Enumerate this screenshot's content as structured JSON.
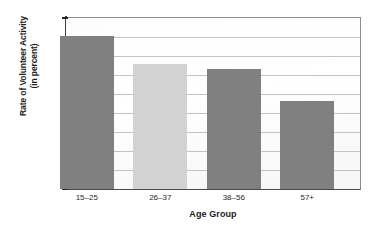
{
  "chart_data": {
    "type": "bar",
    "title": "",
    "categories": [
      "15–25",
      "26–37",
      "38–56",
      "57+"
    ],
    "values": [
      40.3,
      32.8,
      31.7,
      23.1
    ],
    "series": [
      {
        "name": "Rate of Volunteer Activity",
        "values": [
          40.3,
          32.8,
          31.7,
          23.1
        ]
      }
    ],
    "xlabel": "Age Group",
    "ylabel": "Rate of Volunteer Activity (in percent)",
    "ylabel_line1": "Rate of Volunteer Activity",
    "ylabel_line2": "(in percent)",
    "ylim": [
      0,
      45
    ],
    "ytick_step": 5,
    "yticks": [
      45,
      40,
      35,
      30,
      25,
      20,
      15,
      10,
      5,
      0
    ],
    "ytick_labels": [
      "45",
      "40",
      "35",
      "30",
      "25",
      "20",
      "15",
      "10",
      "5",
      "0"
    ],
    "grid": true,
    "grid_axis": "y",
    "legend": false,
    "legend_position": "none",
    "bar_colors": [
      "#808080",
      "#d2d2d2",
      "#808080",
      "#808080"
    ],
    "colors": {
      "bar_dark": "#808080",
      "bar_light": "#d2d2d2",
      "gridline": "#c3c3c3",
      "axis": "#3b3b3b",
      "text": "#1f1f1f",
      "plot_background": "#fdfdfd"
    }
  }
}
